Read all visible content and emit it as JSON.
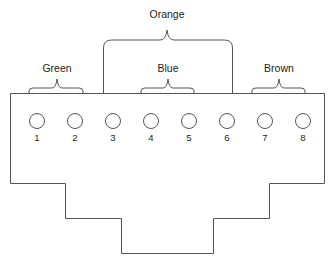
{
  "diagram": {
    "type": "rj45-connector-pinout",
    "pair_labels": {
      "green": "Green",
      "orange": "Orange",
      "blue": "Blue",
      "brown": "Brown"
    },
    "pins": [
      "1",
      "2",
      "3",
      "4",
      "5",
      "6",
      "7",
      "8"
    ],
    "pairs": [
      {
        "label": "Green",
        "pins": [
          1,
          2
        ]
      },
      {
        "label": "Orange",
        "pins": [
          3,
          6
        ]
      },
      {
        "label": "Blue",
        "pins": [
          4,
          5
        ]
      },
      {
        "label": "Brown",
        "pins": [
          7,
          8
        ]
      }
    ],
    "colors": {
      "stroke": "#555555",
      "text": "#222222",
      "background": "#ffffff"
    }
  }
}
